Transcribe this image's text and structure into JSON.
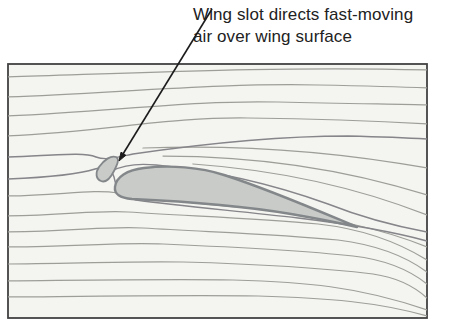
{
  "caption": {
    "line1": "Wing slot directs fast-moving",
    "line2": "air over wing surface"
  },
  "figure": {
    "kind": "streamline-airflow-diagram",
    "parts": [
      "airflow-streamlines",
      "wing-slot-slat",
      "main-wing-airfoil",
      "leader-arrow",
      "border-frame"
    ]
  },
  "colors": {
    "page_bg": "#ffffff",
    "field_bg": "#f4f4f0",
    "frame_stroke": "#424242",
    "streamline": "#9e9e99",
    "streamline_dark": "#85858a",
    "airfoil_fill": "#c9cbc8",
    "airfoil_stroke": "#83878a",
    "arrow": "#1c1c1c",
    "caption_text": "#222222"
  }
}
